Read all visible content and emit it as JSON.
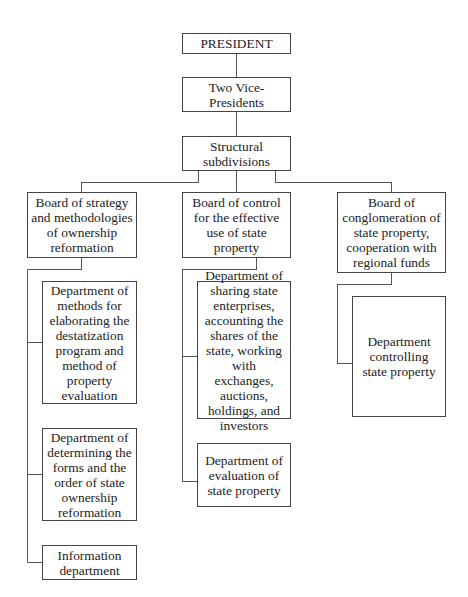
{
  "page_header": "",
  "chart": {
    "type": "org-chart",
    "root": {
      "label": "PRESIDENT",
      "child": {
        "label": "Two Vice-Presidents",
        "child": {
          "label": "Structural subdivisions",
          "boards": [
            {
              "label": "Board of strategy and methodologies of ownership reformation",
              "departments": [
                "Department of methods for elaborating the destatization program and method of property evaluation",
                "Department of determining the forms and the order of state ownership reformation",
                "Information department"
              ]
            },
            {
              "label": "Board of control for the effective use of state property",
              "departments": [
                "Department of sharing state enterprises, accounting the shares of the state, working with exchanges, auctions, holdings, and investors",
                "Department of evaluation of state property"
              ]
            },
            {
              "label": "Board of conglomeration of state property, cooperation with regional funds",
              "departments": [
                "Department controlling state property"
              ]
            }
          ]
        }
      }
    }
  },
  "nodes": {
    "president": "PRESIDENT",
    "vice_presidents": "Two Vice-Presidents",
    "structural": "Structural subdivisions",
    "board_strategy": "Board of strategy and methodologies of ownership reformation",
    "board_control": "Board of control for the effective use of state property",
    "board_conglomeration": "Board of conglomeration of state property, cooperation with regional funds",
    "dept_methods": "Department of methods for elaborating the destatization program and method of property evaluation",
    "dept_forms": "Department of determining the forms and the order of state ownership reformation",
    "dept_information": "Information department",
    "dept_sharing": "Department of sharing state enterprises, accounting the shares of the state, working with exchanges, auctions, holdings, and investors",
    "dept_evaluation": "Department of evaluation of state property",
    "dept_controlling": "Department controlling state property"
  },
  "colors": {
    "line": "#555555",
    "border": "#444444",
    "text": "#222222",
    "background": "#ffffff"
  }
}
